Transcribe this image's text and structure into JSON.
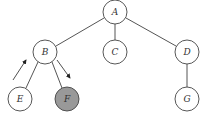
{
  "diagram": {
    "type": "tree",
    "colors": {
      "default_fill": "#ffffff",
      "highlight_fill": "#999999",
      "stroke": "#444444"
    },
    "nodes": [
      {
        "id": "A",
        "label": "A",
        "x": 115,
        "y": 12
      },
      {
        "id": "B",
        "label": "B",
        "x": 45,
        "y": 52
      },
      {
        "id": "C",
        "label": "C",
        "x": 115,
        "y": 52
      },
      {
        "id": "D",
        "label": "D",
        "x": 187,
        "y": 52
      },
      {
        "id": "E",
        "label": "E",
        "x": 20,
        "y": 99
      },
      {
        "id": "F",
        "label": "F",
        "x": 67,
        "y": 99,
        "highlighted": true
      },
      {
        "id": "G",
        "label": "G",
        "x": 187,
        "y": 99
      }
    ],
    "edges": [
      [
        "A",
        "B"
      ],
      [
        "A",
        "C"
      ],
      [
        "A",
        "D"
      ],
      [
        "B",
        "E"
      ],
      [
        "B",
        "F"
      ],
      [
        "D",
        "G"
      ]
    ],
    "traversal_arrows": [
      {
        "beside_edge": "E-B",
        "direction": "up"
      },
      {
        "beside_edge": "B-F",
        "direction": "down"
      }
    ]
  }
}
